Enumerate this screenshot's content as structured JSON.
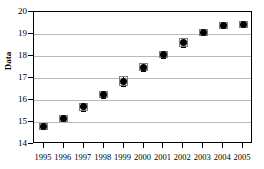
{
  "chart_data": {
    "type": "scatter",
    "title": "",
    "xlabel": "",
    "ylabel": "Data",
    "categories": [
      "1995",
      "1996",
      "1997",
      "1998",
      "1999",
      "2000",
      "2001",
      "2002",
      "2003",
      "2004",
      "2005"
    ],
    "x": [
      1995,
      1996,
      1997,
      1998,
      1999,
      2000,
      2001,
      2002,
      2003,
      2004,
      2005
    ],
    "values": [
      14.8,
      15.15,
      15.7,
      16.25,
      16.85,
      17.5,
      18.05,
      18.6,
      19.05,
      19.4,
      19.45
    ],
    "errors": [
      0.12,
      0.12,
      0.18,
      0.14,
      0.22,
      0.18,
      0.12,
      0.2,
      0.1,
      0.07,
      0.07
    ],
    "xlim": [
      1994.5,
      2005.5
    ],
    "ylim": [
      14,
      20
    ],
    "yticks": [
      14,
      15,
      16,
      17,
      18,
      19,
      20
    ],
    "ytick_labels": [
      "14",
      "15",
      "16",
      "17",
      "18",
      "19",
      "20"
    ],
    "xticks": [
      1995,
      1996,
      1997,
      1998,
      1999,
      2000,
      2001,
      2002,
      2003,
      2004,
      2005
    ],
    "grid": "horizontal",
    "legend": "none",
    "marker_color": "#000000",
    "grid_color": "#b9b9b9",
    "frame_color": "#000000"
  }
}
